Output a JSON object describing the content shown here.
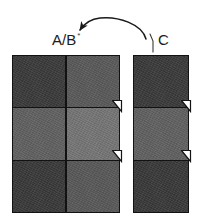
{
  "figure": {
    "background_color": "#ffffff",
    "ink_color": "#121212"
  },
  "labels": {
    "ab": {
      "text": "A/B",
      "superscript": "*",
      "name": "label-a-b"
    },
    "c": {
      "text": "C",
      "name": "label-c"
    }
  },
  "annotations": {
    "arrow": {
      "name": "curved-arrow",
      "description": "curved arrow arcing from C block leader line to the A/B block",
      "direction": "right-to-left",
      "head_at": "A/B"
    },
    "leader_line": {
      "name": "c-leader-line",
      "description": "short leader line from C label down to the C block"
    },
    "ticks": [
      {
        "name": "tick-ab-top",
        "block": "A/B",
        "at": "middle-row-top-boundary"
      },
      {
        "name": "tick-ab-bottom",
        "block": "A/B",
        "at": "middle-row-bottom-boundary"
      },
      {
        "name": "tick-c-top",
        "block": "C",
        "at": "middle-row-top-boundary"
      },
      {
        "name": "tick-c-bottom",
        "block": "C",
        "at": "middle-row-bottom-boundary"
      }
    ]
  },
  "blocks": [
    {
      "name": "block-ab",
      "label": "A/B",
      "columns": 2,
      "rows": 3,
      "cells": [
        {
          "name": "cell-ab-r1c1",
          "row": 1,
          "col": 1,
          "color": "#3b3b3b"
        },
        {
          "name": "cell-ab-r1c2",
          "row": 1,
          "col": 2,
          "color": "#5a5a5a"
        },
        {
          "name": "cell-ab-r2c1",
          "row": 2,
          "col": 1,
          "color": "#616161"
        },
        {
          "name": "cell-ab-r2c2",
          "row": 2,
          "col": 2,
          "color": "#767676"
        },
        {
          "name": "cell-ab-r3c1",
          "row": 3,
          "col": 1,
          "color": "#3a3a3a"
        },
        {
          "name": "cell-ab-r3c2",
          "row": 3,
          "col": 2,
          "color": "#595959"
        }
      ]
    },
    {
      "name": "block-c",
      "label": "C",
      "columns": 1,
      "rows": 3,
      "cells": [
        {
          "name": "cell-c-r1c1",
          "row": 1,
          "col": 1,
          "color": "#3b3b3b"
        },
        {
          "name": "cell-c-r2c1",
          "row": 2,
          "col": 1,
          "color": "#616161"
        },
        {
          "name": "cell-c-r3c1",
          "row": 3,
          "col": 1,
          "color": "#3a3a3a"
        }
      ]
    }
  ]
}
